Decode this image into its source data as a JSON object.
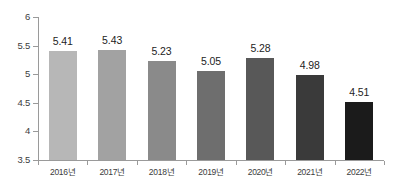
{
  "chart_data": {
    "type": "bar",
    "title": "",
    "subtitle": "",
    "xlabel": "",
    "ylabel": "",
    "categories": [
      "2016년",
      "2017년",
      "2018년",
      "2019년",
      "2020년",
      "2021년",
      "2022년"
    ],
    "values": [
      5.41,
      5.43,
      5.23,
      5.05,
      5.28,
      4.98,
      4.51
    ],
    "value_labels": [
      "5.41",
      "5.43",
      "5.23",
      "5.05",
      "5.28",
      "4.98",
      "4.51"
    ],
    "ylim": [
      3.5,
      6
    ],
    "y_ticks": [
      3.5,
      4,
      4.5,
      5,
      5.5,
      6
    ],
    "y_tick_labels": [
      "3.5",
      "4",
      "4.5",
      "5",
      "5.5",
      "6"
    ],
    "grid": false,
    "legend": false,
    "legend_position": "none",
    "bar_colors": [
      "#b7b7b7",
      "#a2a2a2",
      "#8a8a8a",
      "#6e6e6e",
      "#585858",
      "#3a3a3a",
      "#1b1b1b"
    ],
    "axis_color": "#9a9a9a",
    "label_color": "#3c3c3c",
    "value_color": "#232323",
    "background": "#ffffff",
    "series": [
      {
        "name": "값",
        "values": [
          5.41,
          5.43,
          5.23,
          5.05,
          5.28,
          4.98,
          4.51
        ]
      }
    ]
  }
}
